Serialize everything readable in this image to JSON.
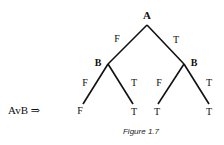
{
  "diagram": {
    "type": "truth-tree",
    "expression": "AvB ⇒",
    "root": {
      "label": "A"
    },
    "level1": [
      {
        "edge_label": "F",
        "node_label": "B"
      },
      {
        "edge_label": "T",
        "node_label": "B"
      }
    ],
    "level2": [
      {
        "edge_label": "F",
        "leaf": "F"
      },
      {
        "edge_label": "T",
        "leaf": "T"
      },
      {
        "edge_label": "F",
        "leaf": "T"
      },
      {
        "edge_label": "T",
        "leaf": "T"
      }
    ],
    "caption": "Figure 1.7"
  }
}
